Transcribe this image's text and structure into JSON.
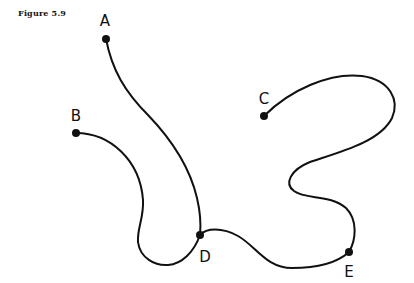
{
  "figure": {
    "caption": "Figure 5.9",
    "colors": {
      "ink": "#111111",
      "background": "#ffffff"
    },
    "nodes": [
      {
        "id": "A",
        "label": "A"
      },
      {
        "id": "B",
        "label": "B"
      },
      {
        "id": "C",
        "label": "C"
      },
      {
        "id": "D",
        "label": "D"
      },
      {
        "id": "E",
        "label": "E"
      }
    ],
    "edges": [
      {
        "from": "A",
        "to": "D"
      },
      {
        "from": "B",
        "to": "D"
      },
      {
        "from": "D",
        "to": "E"
      },
      {
        "from": "C",
        "to": "E"
      }
    ]
  }
}
